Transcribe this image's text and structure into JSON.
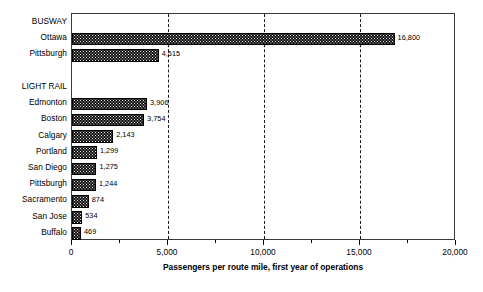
{
  "chart_data": {
    "type": "bar",
    "orientation": "horizontal",
    "title": "",
    "xlabel": "Passengers per route mile, first year of operations",
    "ylabel": "",
    "xlim": [
      0,
      20000
    ],
    "xticks": [
      0,
      5000,
      10000,
      15000,
      20000
    ],
    "xticklabels": [
      "0",
      "5,000",
      "10,000",
      "15,000",
      "20,000"
    ],
    "grid": "vertical-dashed-at-major-ticks",
    "legend": "none",
    "categories": [
      "BUSWAY",
      "Ottawa",
      "Pittsburgh",
      "",
      "LIGHT RAIL",
      "Edmonton",
      "Boston",
      "Calgary",
      "Portland",
      "San Diego",
      "Pittsburgh",
      "Sacramento",
      "San Jose",
      "Buffalo"
    ],
    "values": [
      null,
      16800,
      4515,
      null,
      null,
      3906,
      3754,
      2143,
      1299,
      1275,
      1244,
      874,
      534,
      469
    ],
    "value_labels": [
      "",
      "16,800",
      "4,515",
      "",
      "",
      "3,906",
      "3,754",
      "2,143",
      "1,299",
      "1,275",
      "1,244",
      "874",
      "534",
      "469"
    ],
    "group_headers": [
      "BUSWAY",
      "LIGHT RAIL"
    ],
    "bar_fill_color": "#111111",
    "bar_edge_color": "#000000",
    "axis_color": "#3a3a3a",
    "background_color": "#ffffff"
  }
}
